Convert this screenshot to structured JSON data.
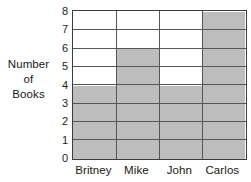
{
  "chart_data": {
    "type": "bar",
    "title": "",
    "subtitle": "",
    "xlabel": "",
    "ylabel": "Number of Books",
    "ylabel_lines": [
      "Number",
      "of",
      "Books"
    ],
    "categories": [
      "Britney",
      "Mike",
      "John",
      "Carlos"
    ],
    "values": [
      4,
      6,
      4,
      8
    ],
    "series": [
      {
        "name": "Books read",
        "values": [
          4,
          6,
          4,
          8
        ]
      }
    ],
    "ylim": [
      0,
      8
    ],
    "y_ticks": [
      0,
      1,
      2,
      3,
      4,
      5,
      6,
      7,
      8
    ],
    "y_tick_labels": [
      "0",
      "1",
      "2",
      "3",
      "4",
      "5",
      "6",
      "7",
      "8"
    ],
    "y_tick_step": 1,
    "grid": true,
    "grid_axis": "y",
    "legend": false,
    "legend_position": "none",
    "bar_fill_color": "#bdbdbd",
    "bar_edge_color": "#55565a",
    "plot_background": "#ffffff",
    "axis_color": "#3c3c3c",
    "annotations": []
  },
  "axis": {
    "y_title_lines": [
      "Number",
      "of",
      "Books"
    ]
  }
}
